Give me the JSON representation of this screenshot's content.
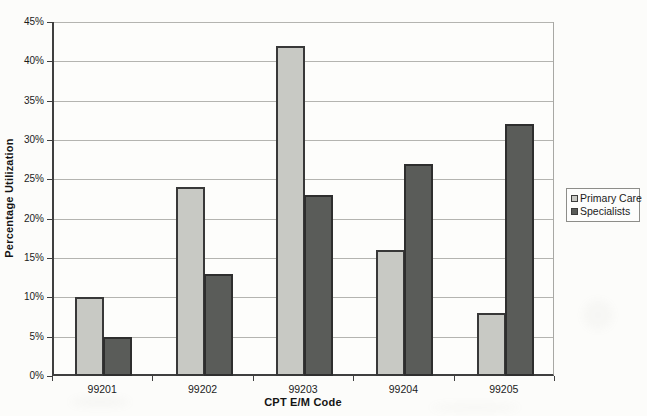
{
  "chart_data": {
    "type": "bar",
    "title": "",
    "xlabel": "CPT E/M Code",
    "ylabel": "Percentage Utilization",
    "categories": [
      "99201",
      "99202",
      "99203",
      "99204",
      "99205"
    ],
    "series": [
      {
        "name": "Primary Care",
        "values": [
          10,
          24,
          42,
          16,
          8
        ],
        "color": "#c8c9c4",
        "border_color": "#383838"
      },
      {
        "name": "Specialists",
        "values": [
          5,
          13,
          23,
          27,
          32
        ],
        "color": "#5a5c59",
        "border_color": "#2e2e2e"
      }
    ],
    "ylim": [
      0,
      45
    ],
    "ytick_step": 5,
    "ytick_labels": [
      "0%",
      "5%",
      "10%",
      "15%",
      "20%",
      "25%",
      "30%",
      "35%",
      "40%",
      "45%"
    ],
    "grid": "horizontal",
    "legend_position": "right",
    "gridline_color": "#b4b4b0",
    "axis_color": "#3f3f3f"
  }
}
